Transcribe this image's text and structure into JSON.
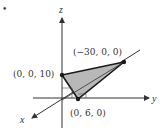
{
  "figure": {
    "bullet": "•",
    "axes": {
      "x_label": "x",
      "y_label": "y",
      "z_label": "z"
    },
    "points": [
      {
        "label": "(0, 0, 10)",
        "coords": [
          0,
          0,
          10
        ]
      },
      {
        "label": "(−30, 0, 0)",
        "coords": [
          -30,
          0,
          0
        ]
      },
      {
        "label": "(0, 6, 0)",
        "coords": [
          0,
          6,
          0
        ]
      }
    ],
    "colors": {
      "fill": "#b8b8b8",
      "stroke": "#1a1a1a",
      "axis": "#333333"
    }
  }
}
